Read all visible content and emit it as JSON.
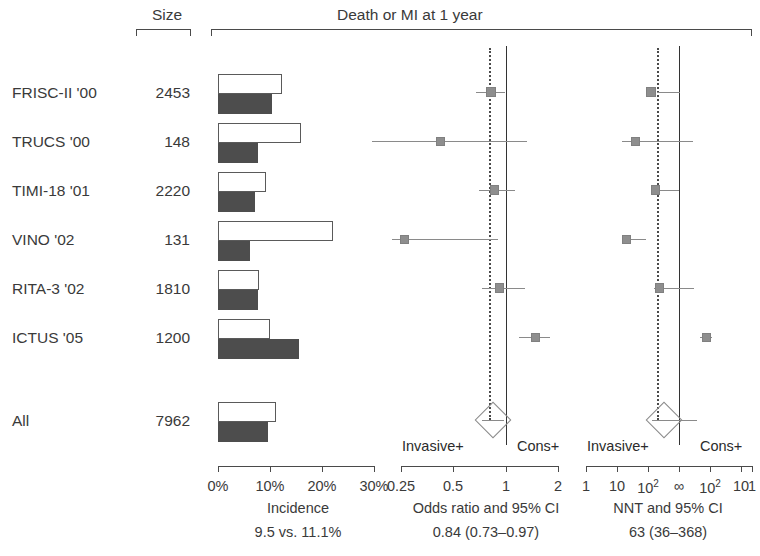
{
  "figure": {
    "title": "Death or MI at 1 year",
    "size_header": "Size"
  },
  "columns": {
    "incidence": {
      "footer_title": "Incidence",
      "footer_value": "9.5 vs. 11.1%",
      "tick_labels": [
        "0%",
        "10%",
        "20%",
        "30%"
      ]
    },
    "odds_ratio": {
      "footer_title": "Odds ratio and 95% CI",
      "footer_value": "0.84 (0.73–0.97)",
      "tick_labels": [
        "0.25",
        "0.5",
        "1",
        "2"
      ],
      "left_side_label": "Invasive+",
      "right_side_label": "Cons+"
    },
    "nnt": {
      "footer_title": "NNT and 95% CI",
      "footer_value": "63 (36–368)",
      "tick_labels": [
        "1",
        "10",
        "10²",
        "∞",
        "10²",
        "10",
        "1"
      ],
      "left_side_label": "Invasive+",
      "right_side_label": "Cons+"
    }
  },
  "chart_data": {
    "type": "table",
    "title": "Death or MI at 1 year",
    "columns": [
      "Study",
      "Size",
      "Incidence invasive (%)",
      "Incidence conservative (%)",
      "Odds ratio",
      "OR 95% CI low",
      "OR 95% CI high"
    ],
    "rows": [
      {
        "study": "FRISC-II '00",
        "size": "2453",
        "incidence_open_pct": 12.2,
        "incidence_fill_pct": 10.4,
        "or": 0.82,
        "or_low": 0.67,
        "or_high": 0.99,
        "nnt_log_pos": 0.55,
        "nnt_ci_low": 0.64,
        "nnt_ci_high": 1.02
      },
      {
        "study": "TRUCS '00",
        "size": "148",
        "incidence_open_pct": 15.9,
        "incidence_fill_pct": 7.6,
        "or": 0.42,
        "or_low": 0.17,
        "or_high": 1.33,
        "nnt_log_pos": 0.3,
        "nnt_ci_low": 0.08,
        "nnt_ci_high": 1.22
      },
      {
        "study": "TIMI-18 '01",
        "size": "2220",
        "incidence_open_pct": 9.2,
        "incidence_fill_pct": 7.0,
        "or": 0.86,
        "or_low": 0.7,
        "or_high": 1.12,
        "nnt_log_pos": 0.62,
        "nnt_ci_low": 0.55,
        "nnt_ci_high": 1.0
      },
      {
        "study": "VINO '02",
        "size": "131",
        "incidence_open_pct": 22.1,
        "incidence_fill_pct": 6.2,
        "or": 0.26,
        "or_low": 0.22,
        "or_high": 0.9,
        "nnt_log_pos": 0.16,
        "nnt_ci_low": 0.13,
        "nnt_ci_high": 0.46
      },
      {
        "study": "RITA-3 '02",
        "size": "1810",
        "incidence_open_pct": 7.9,
        "incidence_fill_pct": 7.6,
        "or": 0.92,
        "or_low": 0.73,
        "or_high": 1.28,
        "nnt_log_pos": 0.68,
        "nnt_ci_low": 0.6,
        "nnt_ci_high": 1.24
      },
      {
        "study": "ICTUS '05",
        "size": "1200",
        "incidence_open_pct": 10.0,
        "incidence_fill_pct": 15.6,
        "or": 1.47,
        "or_low": 1.18,
        "or_high": 1.8,
        "nnt_log_pos": 1.44,
        "nnt_ci_low": 1.34,
        "nnt_ci_high": 1.53
      }
    ],
    "pooled": {
      "study": "All",
      "size": "7962",
      "incidence_open_pct": 11.1,
      "incidence_fill_pct": 9.5,
      "or": 0.84,
      "or_low": 0.73,
      "or_high": 0.97,
      "nnt": 63,
      "nnt_low": 36,
      "nnt_high": 368
    },
    "axes": {
      "incidence": {
        "min": 0,
        "max": 30,
        "ticks": [
          0,
          10,
          20,
          30
        ],
        "unit": "%"
      },
      "odds_ratio": {
        "scale": "log",
        "min": 0.25,
        "max": 2,
        "ticks": [
          0.25,
          0.5,
          1,
          2
        ],
        "reference": 1
      },
      "nnt": {
        "scale": "mirrored-log",
        "ticks": [
          "1",
          "10",
          "10^2",
          "inf",
          "10^2",
          "10",
          "1"
        ]
      }
    }
  }
}
